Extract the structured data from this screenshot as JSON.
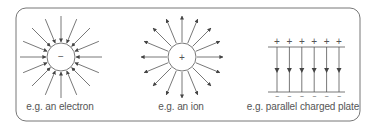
{
  "panels": [
    {
      "id": "electron",
      "label": "e.g. an electron",
      "charge_symbol": "−",
      "field_direction": "inward",
      "arrow_count": 16
    },
    {
      "id": "ion",
      "label": "e.g. an ion",
      "charge_symbol": "+",
      "field_direction": "outward",
      "arrow_count": 16
    },
    {
      "id": "plates",
      "label": "e.g. parallel charged plate",
      "top_symbol": "+",
      "bottom_symbol": "−",
      "field_lines": 6
    }
  ],
  "colors": {
    "stroke": "#555555",
    "text": "#555555",
    "border": "#666666"
  }
}
